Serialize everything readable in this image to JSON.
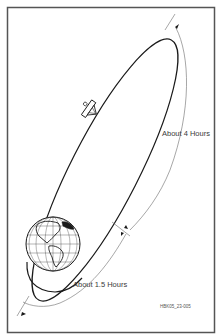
{
  "diagram": {
    "type": "orbit-diagram",
    "labels": {
      "apogee_arc": "About 4 Hours",
      "perigee_arc": "About 1.5 Hours",
      "figure_code": "HBK05_23-005"
    },
    "elements": [
      {
        "name": "earth",
        "description": "Globe showing the Americas with latitude/longitude grid, at lower-left focus of orbit"
      },
      {
        "name": "orbit",
        "description": "Elongated ellipse tilted toward upper right"
      },
      {
        "name": "satellite",
        "description": "Small satellite with dish antenna on the orbit path"
      },
      {
        "name": "apogee-arc-arrow",
        "description": "Thin curved arc outside orbit along the far portion, arrow at top end"
      },
      {
        "name": "perigee-arc-arrow",
        "description": "Thin curved arc outside orbit near Earth, arrow at bottom-left end"
      },
      {
        "name": "divider-tick",
        "description": "Short crossing tick marks separating the two arc durations"
      }
    ],
    "colors": {
      "line": "#1a1a1a",
      "thin_line": "#6b6b6b",
      "frame": "#555555",
      "background": "#ffffff"
    }
  }
}
